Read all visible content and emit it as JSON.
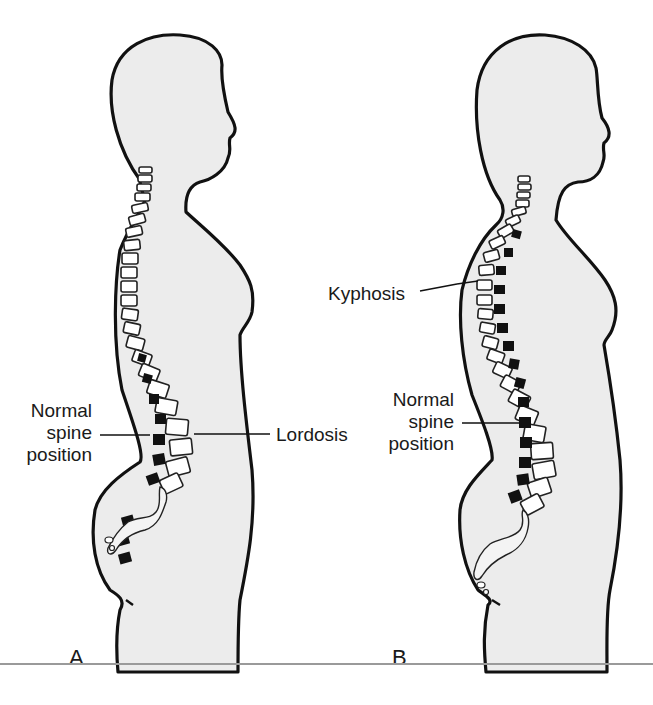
{
  "figure": {
    "panels": [
      {
        "id": "A",
        "letter": "A",
        "labels": {
          "normal_spine": "Normal\nspine\nposition",
          "normal_spine_lines": [
            "Normal",
            "spine",
            "position"
          ],
          "condition": "Lordosis"
        }
      },
      {
        "id": "B",
        "letter": "B",
        "labels": {
          "condition": "Kyphosis",
          "normal_spine_lines": [
            "Normal",
            "spine",
            "position"
          ]
        }
      }
    ],
    "colors": {
      "body_fill": "#ececec",
      "outline": "#111111",
      "vertebra_fill": "#ffffff",
      "shifted_vertebra": "#111111",
      "rule": "#9a9a9a"
    }
  }
}
